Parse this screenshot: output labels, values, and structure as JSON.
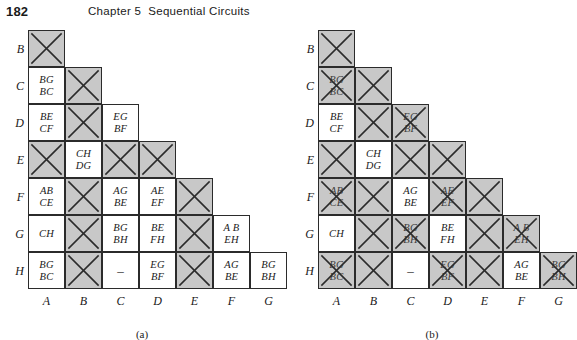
{
  "header": {
    "folio": "182",
    "chapter": "Chapter 5",
    "title": "Sequential Circuits"
  },
  "charts": [
    {
      "caption": "(a)",
      "row_labels": [
        "B",
        "C",
        "D",
        "E",
        "F",
        "G",
        "H"
      ],
      "col_labels": [
        "A",
        "B",
        "C",
        "D",
        "E",
        "F",
        "G"
      ],
      "rows": [
        {
          "label": "B",
          "cells": [
            {
              "col": "A",
              "state": "crossed",
              "text": []
            }
          ]
        },
        {
          "label": "C",
          "cells": [
            {
              "col": "A",
              "state": "text",
              "text": [
                "BG",
                "BC"
              ]
            },
            {
              "col": "B",
              "state": "crossed",
              "text": []
            }
          ]
        },
        {
          "label": "D",
          "cells": [
            {
              "col": "A",
              "state": "text",
              "text": [
                "BE",
                "CF"
              ]
            },
            {
              "col": "B",
              "state": "crossed",
              "text": []
            },
            {
              "col": "C",
              "state": "text",
              "text": [
                "EG",
                "BF"
              ]
            }
          ]
        },
        {
          "label": "E",
          "cells": [
            {
              "col": "A",
              "state": "crossed",
              "text": []
            },
            {
              "col": "B",
              "state": "text",
              "text": [
                "CH",
                "DG"
              ]
            },
            {
              "col": "C",
              "state": "crossed",
              "text": []
            },
            {
              "col": "D",
              "state": "crossed",
              "text": []
            }
          ]
        },
        {
          "label": "F",
          "cells": [
            {
              "col": "A",
              "state": "text",
              "text": [
                "AB",
                "CE"
              ]
            },
            {
              "col": "B",
              "state": "crossed",
              "text": []
            },
            {
              "col": "C",
              "state": "text",
              "text": [
                "AG",
                "BE"
              ]
            },
            {
              "col": "D",
              "state": "text",
              "text": [
                "AE",
                "EF"
              ]
            },
            {
              "col": "E",
              "state": "crossed",
              "text": []
            }
          ]
        },
        {
          "label": "G",
          "cells": [
            {
              "col": "A",
              "state": "text",
              "text": [
                "CH"
              ]
            },
            {
              "col": "B",
              "state": "crossed",
              "text": []
            },
            {
              "col": "C",
              "state": "text",
              "text": [
                "BG",
                "BH"
              ]
            },
            {
              "col": "D",
              "state": "text",
              "text": [
                "BE",
                "FH"
              ]
            },
            {
              "col": "E",
              "state": "crossed",
              "text": []
            },
            {
              "col": "F",
              "state": "text",
              "text": [
                "A B",
                "EH"
              ]
            }
          ]
        },
        {
          "label": "H",
          "cells": [
            {
              "col": "A",
              "state": "text",
              "text": [
                "BG",
                "BC"
              ]
            },
            {
              "col": "B",
              "state": "crossed",
              "text": []
            },
            {
              "col": "C",
              "state": "dash",
              "text": [
                "–"
              ]
            },
            {
              "col": "D",
              "state": "text",
              "text": [
                "EG",
                "BF"
              ]
            },
            {
              "col": "E",
              "state": "crossed",
              "text": []
            },
            {
              "col": "F",
              "state": "text",
              "text": [
                "AG",
                "BE"
              ]
            },
            {
              "col": "G",
              "state": "text",
              "text": [
                "BG",
                "BH"
              ]
            }
          ]
        }
      ]
    },
    {
      "caption": "(b)",
      "row_labels": [
        "B",
        "C",
        "D",
        "E",
        "F",
        "G",
        "H"
      ],
      "col_labels": [
        "A",
        "B",
        "C",
        "D",
        "E",
        "F",
        "G"
      ],
      "rows": [
        {
          "label": "B",
          "cells": [
            {
              "col": "A",
              "state": "crossed",
              "text": []
            }
          ]
        },
        {
          "label": "C",
          "cells": [
            {
              "col": "A",
              "state": "struck",
              "text": [
                "BG",
                "BC"
              ]
            },
            {
              "col": "B",
              "state": "crossed",
              "text": []
            }
          ]
        },
        {
          "label": "D",
          "cells": [
            {
              "col": "A",
              "state": "text",
              "text": [
                "BE",
                "CF"
              ]
            },
            {
              "col": "B",
              "state": "crossed",
              "text": []
            },
            {
              "col": "C",
              "state": "struck",
              "text": [
                "EG",
                "BF"
              ]
            }
          ]
        },
        {
          "label": "E",
          "cells": [
            {
              "col": "A",
              "state": "crossed",
              "text": []
            },
            {
              "col": "B",
              "state": "text",
              "text": [
                "CH",
                "DG"
              ]
            },
            {
              "col": "C",
              "state": "crossed",
              "text": []
            },
            {
              "col": "D",
              "state": "crossed",
              "text": []
            }
          ]
        },
        {
          "label": "F",
          "cells": [
            {
              "col": "A",
              "state": "struck",
              "text": [
                "AB",
                "CE"
              ]
            },
            {
              "col": "B",
              "state": "crossed",
              "text": []
            },
            {
              "col": "C",
              "state": "text",
              "text": [
                "AG",
                "BE"
              ]
            },
            {
              "col": "D",
              "state": "struck",
              "text": [
                "AE",
                "EF"
              ]
            },
            {
              "col": "E",
              "state": "crossed",
              "text": []
            }
          ]
        },
        {
          "label": "G",
          "cells": [
            {
              "col": "A",
              "state": "text",
              "text": [
                "CH"
              ]
            },
            {
              "col": "B",
              "state": "crossed",
              "text": []
            },
            {
              "col": "C",
              "state": "struck",
              "text": [
                "BG",
                "BH"
              ]
            },
            {
              "col": "D",
              "state": "text",
              "text": [
                "BE",
                "FH"
              ]
            },
            {
              "col": "E",
              "state": "crossed",
              "text": []
            },
            {
              "col": "F",
              "state": "struck",
              "text": [
                "A B",
                "EH"
              ]
            }
          ]
        },
        {
          "label": "H",
          "cells": [
            {
              "col": "A",
              "state": "struck",
              "text": [
                "BG",
                "BC"
              ]
            },
            {
              "col": "B",
              "state": "crossed",
              "text": []
            },
            {
              "col": "C",
              "state": "dash",
              "text": [
                "–"
              ]
            },
            {
              "col": "D",
              "state": "struck",
              "text": [
                "EG",
                "BF"
              ]
            },
            {
              "col": "E",
              "state": "crossed",
              "text": []
            },
            {
              "col": "F",
              "state": "text",
              "text": [
                "AG",
                "BE"
              ]
            },
            {
              "col": "G",
              "state": "struck",
              "text": [
                "BG",
                "BH"
              ]
            }
          ]
        }
      ]
    }
  ]
}
